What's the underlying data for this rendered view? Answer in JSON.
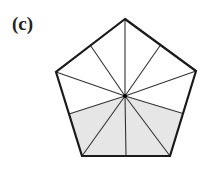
{
  "figure": {
    "label": "(c)",
    "shape": "regular pentagon",
    "divisions": 10,
    "shaded_parts": 4,
    "colors": {
      "outline": "#1a1a1a",
      "inner_lines": "#333333",
      "shade": "#e6e6e6",
      "background": "#ffffff",
      "center_dot": "#000000"
    }
  }
}
